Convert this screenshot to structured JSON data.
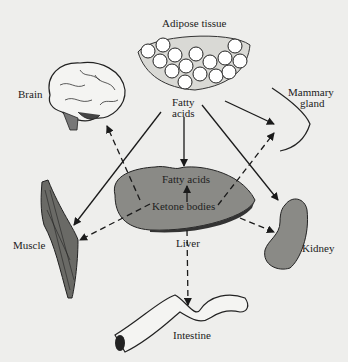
{
  "diagram": {
    "type": "organ-flow-diagram",
    "labels": {
      "adipose": "Adipose tissue",
      "fatty_acids_source_1": "Fatty",
      "fatty_acids_source_2": "acids",
      "brain": "Brain",
      "mammary_1": "Mammary",
      "mammary_2": "gland",
      "liver_fatty_acids": "Fatty acids",
      "liver_ketone": "Ketone bodies",
      "liver": "Liver",
      "muscle": "Muscle",
      "kidney": "Kidney",
      "intestine": "Intestine"
    },
    "legend": {
      "solid_arrow": "fatty acids",
      "dashed_arrow": "ketone bodies"
    },
    "colors": {
      "background": "#eeeeec",
      "organ_fill": "#8a8a86",
      "line": "#1a1a1a"
    }
  }
}
